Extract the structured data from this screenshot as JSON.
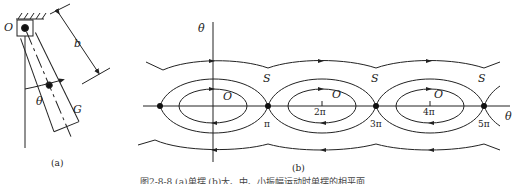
{
  "figure": {
    "caption": "图2-8-8  (a)单摆  (b)大、中、小振幅运动时单摆的相平面",
    "panel_a": {
      "label": "(a)",
      "pivot_label": "O",
      "length_label": "b",
      "angle_label": "θ",
      "cg_label": "G"
    },
    "panel_b": {
      "label": "(b)",
      "y_axis_label": "θ̇",
      "x_axis_label": "θ",
      "center_label": "O",
      "separatrix_label": "S",
      "tick_labels": [
        "π",
        "2π",
        "3π",
        "4π",
        "5π"
      ]
    }
  }
}
